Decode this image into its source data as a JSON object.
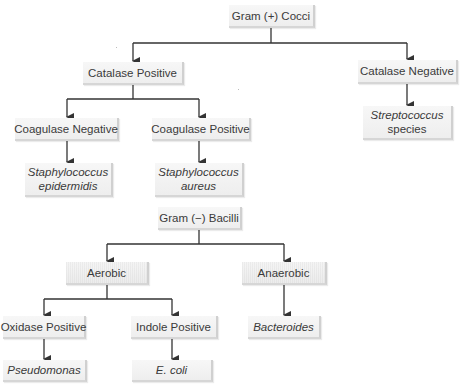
{
  "diagram": {
    "colors": {
      "line": "#333333",
      "box_fill": "#f2f2f2",
      "box_shadow": "#d0d0d0",
      "text": "#3a3a3a"
    },
    "gram_positive": {
      "root": {
        "label": "Gram (+) Cocci"
      },
      "catalase_positive": {
        "label": "Catalase Positive"
      },
      "catalase_negative": {
        "label": "Catalase Negative"
      },
      "coagulase_negative": {
        "label": "Coagulase Negative"
      },
      "coagulase_positive": {
        "label": "Coagulase Positive"
      },
      "staph_epidermidis": {
        "line1": "Staphylococcus",
        "line2": "epidermidis"
      },
      "staph_aureus": {
        "line1": "Staphylococcus",
        "line2": "aureus"
      },
      "streptococcus": {
        "line1": "Streptococcus",
        "line2": "species"
      }
    },
    "gram_negative": {
      "root": {
        "label": "Gram (−) Bacilli"
      },
      "aerobic": {
        "label": "Aerobic"
      },
      "anaerobic": {
        "label": "Anaerobic"
      },
      "oxidase_positive": {
        "label": "Oxidase Positive"
      },
      "indole_positive": {
        "label": "Indole Positive"
      },
      "pseudomonas": {
        "label": "Pseudomonas"
      },
      "e_coli": {
        "label": "E. coli"
      },
      "bacteroides": {
        "label": "Bacteroides"
      }
    },
    "edges": [
      {
        "from": "Gram (+) Cocci",
        "to": "Catalase Positive"
      },
      {
        "from": "Gram (+) Cocci",
        "to": "Catalase Negative"
      },
      {
        "from": "Catalase Positive",
        "to": "Coagulase Negative"
      },
      {
        "from": "Catalase Positive",
        "to": "Coagulase Positive"
      },
      {
        "from": "Coagulase Negative",
        "to": "Staphylococcus epidermidis"
      },
      {
        "from": "Coagulase Positive",
        "to": "Staphylococcus aureus"
      },
      {
        "from": "Catalase Negative",
        "to": "Streptococcus species"
      },
      {
        "from": "Gram (−) Bacilli",
        "to": "Aerobic"
      },
      {
        "from": "Gram (−) Bacilli",
        "to": "Anaerobic"
      },
      {
        "from": "Aerobic",
        "to": "Oxidase Positive"
      },
      {
        "from": "Aerobic",
        "to": "Indole Positive"
      },
      {
        "from": "Oxidase Positive",
        "to": "Pseudomonas"
      },
      {
        "from": "Indole Positive",
        "to": "E. coli"
      },
      {
        "from": "Anaerobic",
        "to": "Bacteroides"
      }
    ]
  }
}
